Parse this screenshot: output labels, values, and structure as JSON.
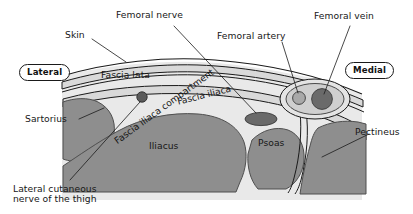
{
  "figure": {
    "type": "anatomical-cross-section",
    "region": "Fascia iliaca compartment of the proximal thigh",
    "orientation_badges": {
      "lateral": "Lateral",
      "medial": "Medial"
    }
  },
  "labels": {
    "skin": "Skin",
    "femoral_nerve": "Femoral nerve",
    "femoral_artery": "Femoral artery",
    "femoral_vein": "Femoral vein",
    "sartorius": "Sartorius",
    "pectineus": "Pectineus",
    "lateral_cutaneous_nerve": "Lateral cutaneous\nnerve of the thigh",
    "fascia_lata": "Fascia lata",
    "fascia_iliaca": "Fascia iliaca",
    "fascia_iliaca_compartment": "Fascia iliaca compartment",
    "iliacus": "Iliacus",
    "psoas": "Psoas"
  },
  "colors": {
    "muscle": "#8e8e8e",
    "muscle_edge": "#5d5d5d",
    "fascia_fill": "#d9d9d9",
    "subcutaneous": "#e9e9e9",
    "vessel_dark": "#6a6a6a",
    "vessel_light": "#a9a9a9",
    "nerve_dot": "#5a5a5a",
    "line": "#1a1a1a",
    "background": "#ffffff"
  }
}
